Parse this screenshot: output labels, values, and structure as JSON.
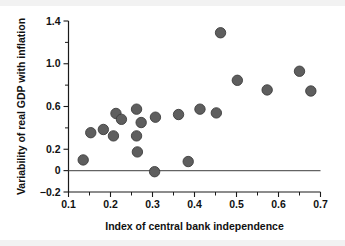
{
  "chart_data": {
    "type": "scatter",
    "title": "",
    "xlabel": "Index of central bank independence",
    "ylabel": "Variability of real GDP with inflation",
    "xlim": [
      0.1,
      0.7
    ],
    "ylim": [
      -0.2,
      1.4
    ],
    "grid": false,
    "legend": null,
    "xticks": [
      0.1,
      0.2,
      0.3,
      0.4,
      0.5,
      0.6,
      0.7
    ],
    "xtick_labels": [
      "0.1",
      "0.2",
      "0.3",
      "0.4",
      "0.5",
      "0.6",
      "0.7"
    ],
    "xticks_minor": [
      0.15,
      0.25,
      0.35,
      0.45,
      0.55,
      0.65
    ],
    "yticks": [
      -0.2,
      0.0,
      0.2,
      0.6,
      1.0,
      1.4
    ],
    "ytick_labels": [
      "-0.2",
      "0",
      "0.2",
      "0.6",
      "1.0",
      "1.4"
    ],
    "yticks_minor": [
      0.4,
      0.8,
      1.2
    ],
    "marker_color": "#5e5e5e",
    "marker_edge_color": "#3d3d3d",
    "marker_size": 5.2,
    "reference_line": {
      "y": 0.0,
      "color": "#636363"
    },
    "points": [
      {
        "x": 0.135,
        "y": 0.1
      },
      {
        "x": 0.153,
        "y": 0.355
      },
      {
        "x": 0.183,
        "y": 0.385
      },
      {
        "x": 0.207,
        "y": 0.325
      },
      {
        "x": 0.213,
        "y": 0.535
      },
      {
        "x": 0.226,
        "y": 0.48
      },
      {
        "x": 0.262,
        "y": 0.575
      },
      {
        "x": 0.262,
        "y": 0.325
      },
      {
        "x": 0.264,
        "y": 0.175
      },
      {
        "x": 0.273,
        "y": 0.45
      },
      {
        "x": 0.305,
        "y": -0.01
      },
      {
        "x": 0.307,
        "y": 0.5
      },
      {
        "x": 0.362,
        "y": 0.525
      },
      {
        "x": 0.385,
        "y": 0.085
      },
      {
        "x": 0.413,
        "y": 0.575
      },
      {
        "x": 0.452,
        "y": 0.54
      },
      {
        "x": 0.462,
        "y": 1.29
      },
      {
        "x": 0.502,
        "y": 0.845
      },
      {
        "x": 0.573,
        "y": 0.755
      },
      {
        "x": 0.65,
        "y": 0.93
      },
      {
        "x": 0.677,
        "y": 0.745
      }
    ]
  }
}
